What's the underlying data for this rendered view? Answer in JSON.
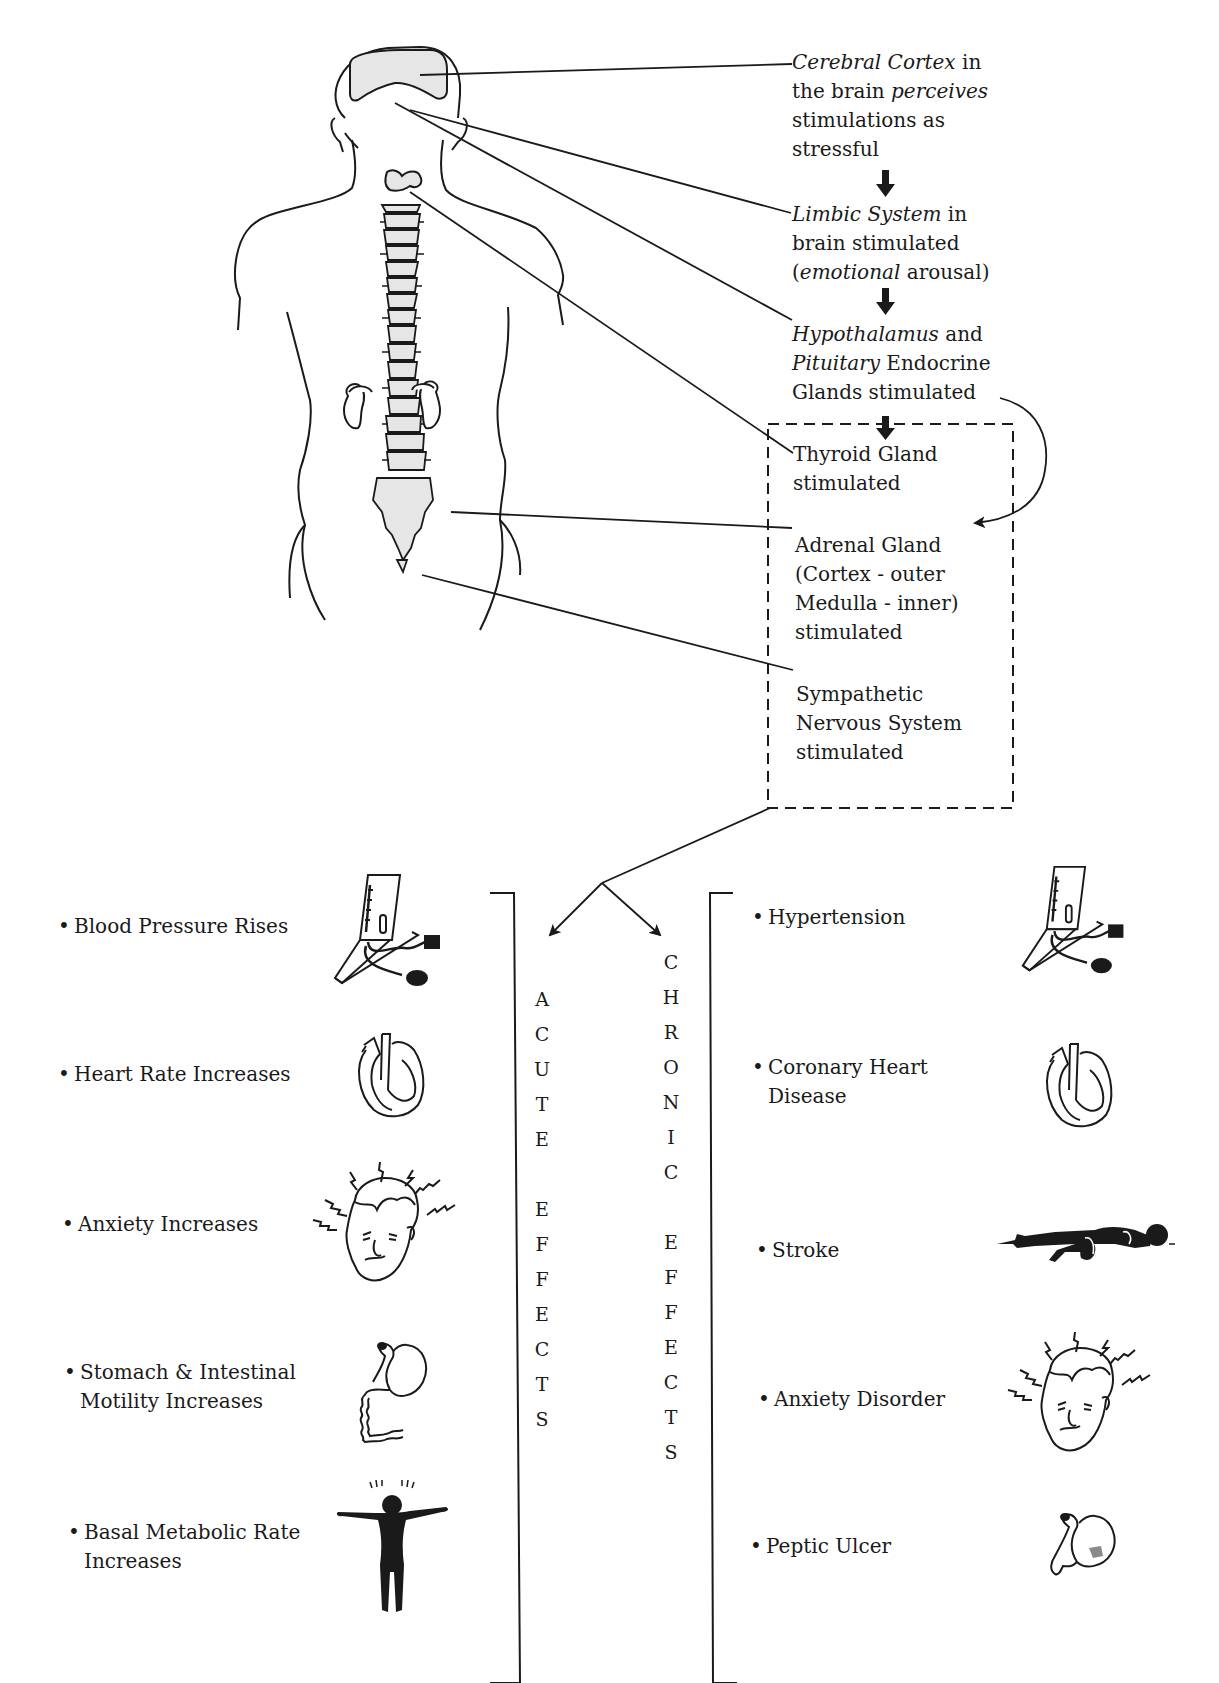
{
  "flow": {
    "cerebral_cortex": {
      "term": "Cerebral Cortex",
      "line1_rest": " in",
      "line2_pre": "the brain ",
      "line2_em": "perceives",
      "line3": "stimulations as",
      "line4": "stressful"
    },
    "limbic_system": {
      "term": "Limbic System",
      "line1_rest": " in",
      "line2": "brain stimulated",
      "line3_open": "(",
      "line3_em": "emotional",
      "line3_rest": " arousal)"
    },
    "hypothalamus": {
      "term1": "Hypothalamus",
      "line1_rest": " and",
      "term2": "Pituitary",
      "line2_rest": " Endocrine",
      "line3": "Glands stimulated"
    },
    "thyroid": {
      "line1": "Thyroid Gland",
      "line2": "stimulated"
    },
    "adrenal": {
      "line1": "Adrenal Gland",
      "line2": "(Cortex - outer",
      "line3": "Medulla - inner)",
      "line4": "stimulated"
    },
    "sympathetic": {
      "line1": "Sympathetic",
      "line2": "Nervous System",
      "line3": "stimulated"
    }
  },
  "acute": {
    "heading_letters": [
      "A",
      "C",
      "U",
      "T",
      "E",
      "",
      "E",
      "F",
      "F",
      "E",
      "C",
      "T",
      "S"
    ],
    "items": [
      {
        "line1": "Blood Pressure Rises",
        "line2": "",
        "icon": "blood-pressure-monitor-icon"
      },
      {
        "line1": "Heart Rate Increases",
        "line2": "",
        "icon": "heart-icon"
      },
      {
        "line1": "Anxiety Increases",
        "line2": "",
        "icon": "anxious-head-icon"
      },
      {
        "line1": "Stomach & Intestinal",
        "line2": "Motility Increases",
        "icon": "stomach-intestine-icon"
      },
      {
        "line1": "Basal Metabolic Rate",
        "line2": "Increases",
        "icon": "energetic-person-icon"
      }
    ]
  },
  "chronic": {
    "heading_letters": [
      "C",
      "H",
      "R",
      "O",
      "N",
      "I",
      "C",
      "",
      "E",
      "F",
      "F",
      "E",
      "C",
      "T",
      "S"
    ],
    "items": [
      {
        "line1": "Hypertension",
        "line2": "",
        "icon": "blood-pressure-monitor-icon"
      },
      {
        "line1": "Coronary Heart",
        "line2": "Disease",
        "icon": "heart-icon"
      },
      {
        "line1": "Stroke",
        "line2": "",
        "icon": "lying-person-icon"
      },
      {
        "line1": "Anxiety Disorder",
        "line2": "",
        "icon": "anxious-head-icon"
      },
      {
        "line1": "Peptic Ulcer",
        "line2": "",
        "icon": "stomach-ulcer-icon"
      }
    ]
  },
  "bullet": "•",
  "colors": {
    "ink": "#1a1a1a",
    "organ_fill": "#e6e6e6",
    "ulcer_fill": "#8a8a8a"
  }
}
